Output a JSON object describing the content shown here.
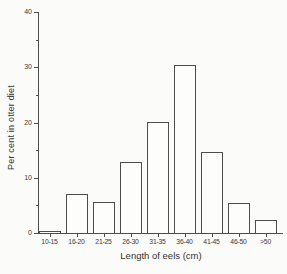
{
  "figure": {
    "background_color": "#fbfbf9",
    "line_color": "#4d4d4d",
    "bar_fill_color": "#fdfdfb",
    "text_color": "#3a3a3a"
  },
  "chart_data": {
    "type": "bar",
    "title": "",
    "xlabel": "Length of eels (cm)",
    "ylabel": "Per cent in otter diet",
    "categories": [
      "10-15",
      "16-20",
      "21-25",
      "26-30",
      "31-35",
      "36-40",
      "41-45",
      "46-50",
      ">50"
    ],
    "values": [
      0.3,
      7.1,
      5.7,
      12.8,
      20.0,
      30.4,
      14.7,
      5.4,
      2.3
    ],
    "ylim": [
      0,
      40
    ],
    "ytick_major": [
      0,
      10,
      20,
      30,
      40
    ],
    "ytick_minor": [
      5,
      15,
      25,
      35
    ],
    "grid": false,
    "legend": null,
    "bar_style": "white fill, dark outline, drawn from baseline"
  }
}
